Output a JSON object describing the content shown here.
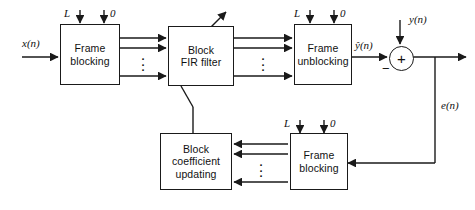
{
  "diagram": {
    "line_color": "#1a1a1a",
    "text_color": "#111111",
    "background": "#ffffff",
    "blocks": [
      {
        "id": "frame-blocking-top",
        "lines": [
          "Frame",
          "blocking"
        ]
      },
      {
        "id": "block-fir-filter",
        "lines": [
          "Block",
          "FIR filter"
        ]
      },
      {
        "id": "frame-unblocking",
        "lines": [
          "Frame",
          "unblocking"
        ]
      },
      {
        "id": "block-coefficient-updating",
        "lines": [
          "Block",
          "coefficient",
          "updating"
        ]
      },
      {
        "id": "frame-blocking-bottom",
        "lines": [
          "Frame",
          "blocking"
        ]
      }
    ],
    "signals": {
      "input": "x(n)",
      "filter_output": "ŷ(n)",
      "desired": "y(n)",
      "error": "e(n)",
      "summer_plus": "+",
      "summer_minus": "−"
    },
    "annotations": {
      "overlap_L": "L",
      "zeros_0": "0",
      "vertical_dots": "⋮"
    }
  }
}
